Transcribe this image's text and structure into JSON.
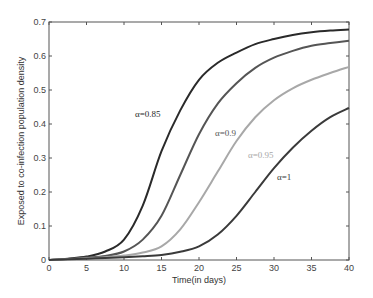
{
  "chart_data": {
    "type": "line",
    "title": "",
    "xlabel": "Time(in days)",
    "ylabel": "Exposed to co-infection population density",
    "xlim": [
      0,
      40
    ],
    "ylim": [
      0,
      0.7
    ],
    "grid": false,
    "legend_position": "inline annotations",
    "x_ticks": [
      0,
      5,
      10,
      15,
      20,
      25,
      30,
      35,
      40
    ],
    "y_ticks": [
      0,
      0.1,
      0.2,
      0.3,
      0.4,
      0.5,
      0.6,
      0.7
    ],
    "x_tick_labels": [
      "0",
      "5",
      "10",
      "15",
      "20",
      "25",
      "30",
      "35",
      "40"
    ],
    "y_tick_labels": [
      "0",
      "0.1",
      "0.2",
      "0.3",
      "0.4",
      "0.5",
      "0.6",
      "0.7"
    ],
    "x": [
      0,
      2.5,
      5,
      7.5,
      10,
      12.5,
      15,
      17.5,
      20,
      22.5,
      25,
      27.5,
      30,
      32.5,
      35,
      37.5,
      40
    ],
    "series": [
      {
        "name": "α=0.85",
        "color": "#2a2a2a",
        "values": [
          0.0,
          0.004,
          0.01,
          0.025,
          0.06,
          0.16,
          0.32,
          0.44,
          0.53,
          0.58,
          0.61,
          0.635,
          0.65,
          0.662,
          0.67,
          0.675,
          0.678
        ],
        "label_pos": [
          135,
          117
        ]
      },
      {
        "name": "α=0.9",
        "color": "#555555",
        "values": [
          0.0,
          0.003,
          0.007,
          0.012,
          0.025,
          0.06,
          0.13,
          0.25,
          0.37,
          0.46,
          0.52,
          0.565,
          0.595,
          0.615,
          0.63,
          0.638,
          0.645
        ],
        "label_pos": [
          215,
          136
        ]
      },
      {
        "name": "α=0.95",
        "color": "#a8a8a8",
        "values": [
          0.0,
          0.002,
          0.005,
          0.008,
          0.013,
          0.022,
          0.04,
          0.09,
          0.17,
          0.26,
          0.35,
          0.42,
          0.47,
          0.505,
          0.53,
          0.55,
          0.568
        ],
        "label_pos": [
          248,
          158
        ]
      },
      {
        "name": "α=1",
        "color": "#3a3a3a",
        "values": [
          0.0,
          0.002,
          0.004,
          0.006,
          0.008,
          0.011,
          0.015,
          0.024,
          0.04,
          0.075,
          0.13,
          0.2,
          0.27,
          0.33,
          0.38,
          0.42,
          0.447
        ],
        "label_pos": [
          277,
          180
        ]
      }
    ]
  }
}
